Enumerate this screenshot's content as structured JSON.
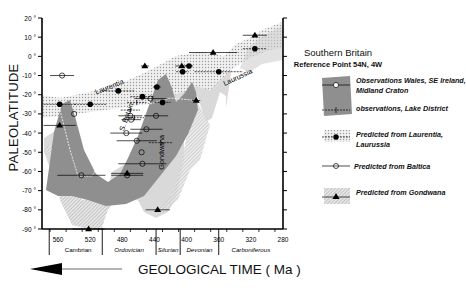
{
  "chart_data": {
    "type": "scatter",
    "title": "Southern Britain",
    "subtitle": "Reference Point 54N, 4W",
    "xlabel": "GEOLOGICAL TIME ( Ma )",
    "ylabel": "PALEOLATITUDE",
    "xlim": [
      580,
      280
    ],
    "ylim": [
      -90,
      20
    ],
    "x_ticks": [
      560,
      520,
      480,
      440,
      400,
      360,
      320,
      280
    ],
    "y_ticks": [
      20,
      10,
      0,
      -10,
      -20,
      -30,
      -40,
      -50,
      -60,
      -70,
      -80,
      -90
    ],
    "y_tick_labels": [
      "20 °",
      "10 °",
      "0 °",
      "-10 °",
      "-20 °",
      "-30 °",
      "-40 °",
      "-50 °",
      "-60 °",
      "-70 °",
      "-80 °",
      "-90 °"
    ],
    "periods": [
      {
        "name": "Cambrian",
        "from": 580,
        "to": 505
      },
      {
        "name": "Ordovician",
        "from": 505,
        "to": 438
      },
      {
        "name": "Silurian",
        "from": 438,
        "to": 408
      },
      {
        "name": "Devonian",
        "from": 408,
        "to": 360
      },
      {
        "name": "Carboniferous",
        "from": 360,
        "to": 280
      }
    ],
    "annotations": [
      {
        "text": "Laurentia",
        "x": 495,
        "y": -17
      },
      {
        "text": "S. Britain",
        "x": 472,
        "y": -32
      },
      {
        "text": "Gondwana",
        "x": 428,
        "y": -50
      },
      {
        "text": "Laurussia",
        "x": 335,
        "y": -12
      }
    ],
    "series": [
      {
        "name": "Observations Wales, SE Ireland, Midland Craton",
        "marker": "open-circle",
        "points": [
          {
            "x": 555,
            "y": -10,
            "xerr": 15
          },
          {
            "x": 540,
            "y": -30,
            "xerr": 0
          },
          {
            "x": 531,
            "y": -62,
            "xerr": 30
          },
          {
            "x": 475,
            "y": -40,
            "xerr": 20
          },
          {
            "x": 470,
            "y": -31,
            "xerr": 15
          },
          {
            "x": 469,
            "y": -33,
            "xerr": 12
          },
          {
            "x": 462,
            "y": -44,
            "xerr": 25
          },
          {
            "x": 456,
            "y": -50,
            "xerr": 0
          },
          {
            "x": 455,
            "y": -56,
            "xerr": 30
          },
          {
            "x": 474,
            "y": -62,
            "xerr": 20
          },
          {
            "x": 450,
            "y": -38,
            "xerr": 20
          },
          {
            "x": 438,
            "y": -31,
            "xerr": 15
          },
          {
            "x": 445,
            "y": -22,
            "xerr": 20
          }
        ]
      },
      {
        "name": "observations, Lake District",
        "marker": "plus",
        "points": [
          {
            "x": 470,
            "y": -28,
            "xerr": 12
          },
          {
            "x": 465,
            "y": -32,
            "xerr": 12
          },
          {
            "x": 462,
            "y": -24,
            "xerr": 12
          },
          {
            "x": 432,
            "y": -45,
            "xerr": 15
          }
        ]
      },
      {
        "name": "Predicted from Laurentia, Laurussia",
        "marker": "filled-circle",
        "points": [
          {
            "x": 558,
            "y": -25,
            "xerr": 20
          },
          {
            "x": 520,
            "y": -25,
            "xerr": 20
          },
          {
            "x": 485,
            "y": -18,
            "xerr": 20
          },
          {
            "x": 455,
            "y": -21,
            "xerr": 15
          },
          {
            "x": 437,
            "y": -16,
            "xerr": 5
          },
          {
            "x": 430,
            "y": -24,
            "xerr": 10
          },
          {
            "x": 405,
            "y": -8,
            "xerr": 8
          },
          {
            "x": 397,
            "y": -5,
            "xerr": 5
          },
          {
            "x": 360,
            "y": -8,
            "xerr": 30
          },
          {
            "x": 315,
            "y": 4,
            "xerr": 15
          }
        ]
      },
      {
        "name": "Predicted from Baltica",
        "marker": "crossed-circle",
        "points": []
      },
      {
        "name": "Predicted from Gondwana",
        "marker": "filled-triangle",
        "points": [
          {
            "x": 558,
            "y": -36,
            "xerr": 20
          },
          {
            "x": 522,
            "y": -90,
            "xerr": 20
          },
          {
            "x": 474,
            "y": -61,
            "xerr": 20
          },
          {
            "x": 436,
            "y": -80,
            "xerr": 15
          },
          {
            "x": 452,
            "y": -5,
            "xerr": 5
          },
          {
            "x": 406,
            "y": -5,
            "xerr": 8
          },
          {
            "x": 388,
            "y": -23,
            "xerr": 5
          },
          {
            "x": 367,
            "y": 2,
            "xerr": 30
          },
          {
            "x": 315,
            "y": 11,
            "xerr": 15
          }
        ]
      }
    ],
    "legend_position": "right"
  },
  "labels": {
    "ylabel": "PALEOLATITUDE",
    "xlabel": "GEOLOGICAL TIME ( Ma )",
    "legend_title": "Southern Britain",
    "legend_subtitle": "Reference Point 54N, 4W",
    "legend": [
      "Observations Wales, SE Ireland, Midland Craton",
      "observations, Lake District",
      "Predicted from Laurentia, Laurussia",
      "Predicted from Baltica",
      "Predicted from Gondwana"
    ]
  }
}
